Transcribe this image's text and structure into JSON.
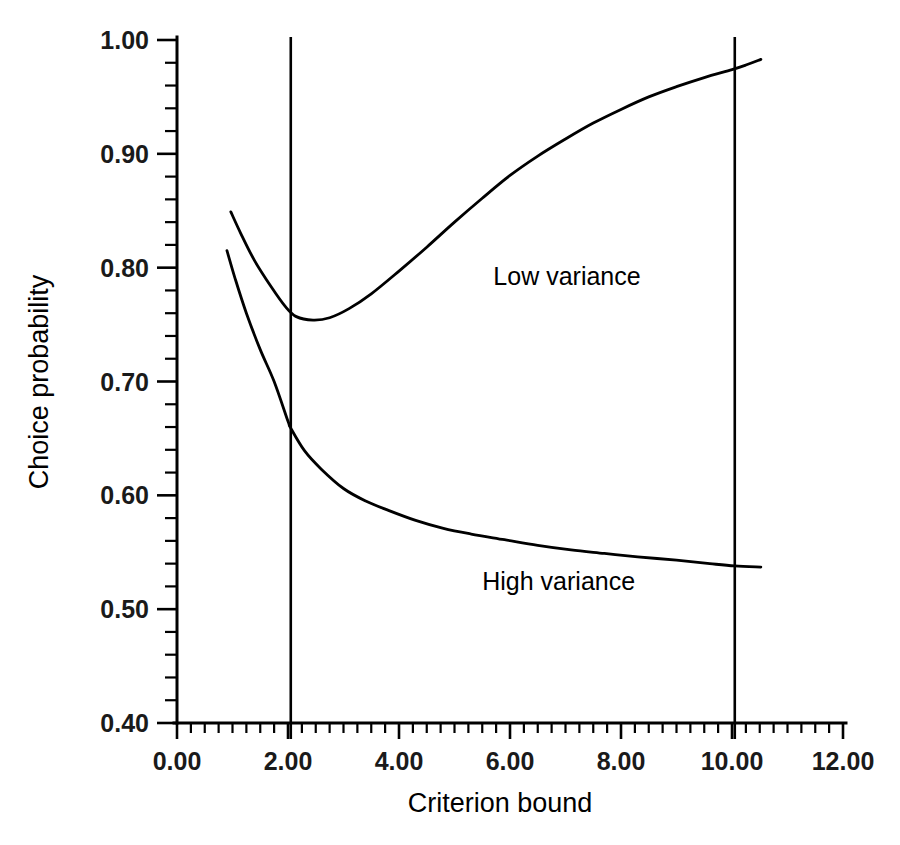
{
  "chart_data": {
    "type": "line",
    "title": "",
    "xlabel": "Criterion bound",
    "ylabel": "Choice probability",
    "xlim": [
      0.0,
      12.0
    ],
    "ylim": [
      0.4,
      1.0
    ],
    "grid": false,
    "legend_position": "inline-annotations",
    "x_ticks": [
      0.0,
      2.0,
      4.0,
      6.0,
      8.0,
      10.0,
      12.0
    ],
    "x_tick_labels": [
      "0.00",
      "2.00",
      "4.00",
      "6.00",
      "8.00",
      "10.00",
      "12.00"
    ],
    "x_minor_step": 0.25,
    "y_ticks": [
      0.4,
      0.5,
      0.6,
      0.7,
      0.8,
      0.9,
      1.0
    ],
    "y_tick_labels": [
      "0.40",
      "0.50",
      "0.60",
      "0.70",
      "0.80",
      "0.90",
      "1.00"
    ],
    "y_minor_step": 0.02,
    "reference_lines": [
      {
        "name": "criterion-bound-2",
        "axis": "x",
        "value": 2.05
      },
      {
        "name": "criterion-bound-10",
        "axis": "x",
        "value": 10.05
      }
    ],
    "annotations": [
      {
        "name": "low-variance-label",
        "text": "Low variance",
        "x": 5.7,
        "y": 0.785
      },
      {
        "name": "high-variance-label",
        "text": "High variance",
        "x": 5.5,
        "y": 0.517
      }
    ],
    "series": [
      {
        "name": "Low variance",
        "x": [
          0.97,
          1.15,
          1.4,
          1.7,
          1.95,
          2.15,
          2.45,
          2.75,
          3.1,
          3.5,
          4.0,
          4.5,
          5.0,
          5.5,
          6.0,
          6.5,
          7.0,
          7.5,
          8.0,
          8.5,
          9.0,
          9.5,
          10.0,
          10.25,
          10.52
        ],
        "y": [
          0.849,
          0.83,
          0.806,
          0.783,
          0.766,
          0.757,
          0.754,
          0.756,
          0.764,
          0.777,
          0.797,
          0.818,
          0.84,
          0.861,
          0.881,
          0.898,
          0.913,
          0.927,
          0.939,
          0.95,
          0.959,
          0.967,
          0.974,
          0.978,
          0.983
        ]
      },
      {
        "name": "High variance",
        "x": [
          0.9,
          1.05,
          1.25,
          1.5,
          1.75,
          2.0,
          2.05,
          2.3,
          2.6,
          3.0,
          3.4,
          3.8,
          4.3,
          4.8,
          5.3,
          5.9,
          6.5,
          7.1,
          7.7,
          8.3,
          9.0,
          9.6,
          10.05,
          10.52
        ],
        "y": [
          0.815,
          0.79,
          0.76,
          0.728,
          0.7,
          0.665,
          0.659,
          0.639,
          0.623,
          0.606,
          0.595,
          0.587,
          0.578,
          0.571,
          0.566,
          0.561,
          0.556,
          0.552,
          0.549,
          0.546,
          0.543,
          0.54,
          0.538,
          0.537
        ]
      }
    ]
  },
  "geometry": {
    "plot_left": 177,
    "plot_right": 843,
    "plot_top": 40,
    "plot_bottom": 723
  }
}
